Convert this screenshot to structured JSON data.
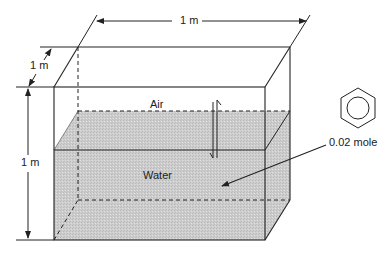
{
  "diagram": {
    "type": "tank-partitioning",
    "tank": {
      "width_label": "1 m",
      "depth_label": "1 m",
      "height_label": "1 m"
    },
    "phases": {
      "air_label": "Air",
      "water_label": "Water"
    },
    "solute": {
      "structure": "benzene-ring",
      "amount_label": "0.02 mole"
    },
    "colors": {
      "line": "#222222",
      "water_fill": "#cfcfcf",
      "background": "#ffffff"
    }
  }
}
